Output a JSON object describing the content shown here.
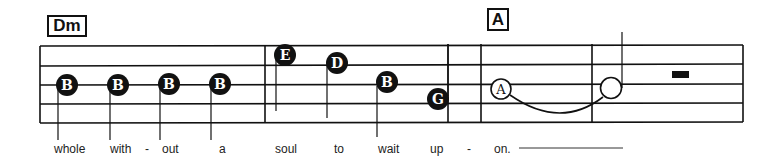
{
  "chords": [
    {
      "label": "Dm"
    },
    {
      "label": "A"
    }
  ],
  "notes": [
    {
      "letter": "B",
      "style": "filled"
    },
    {
      "letter": "B",
      "style": "filled"
    },
    {
      "letter": "B",
      "style": "filled"
    },
    {
      "letter": "B",
      "style": "filled"
    },
    {
      "letter": "E",
      "style": "filled"
    },
    {
      "letter": "D",
      "style": "filled"
    },
    {
      "letter": "B",
      "style": "filled"
    },
    {
      "letter": "G",
      "style": "filled"
    },
    {
      "letter": "A",
      "style": "open"
    },
    {
      "letter": "",
      "style": "open-tied"
    }
  ],
  "lyrics": [
    {
      "text": "whole"
    },
    {
      "text": "with"
    },
    {
      "text": "-"
    },
    {
      "text": "out"
    },
    {
      "text": "a"
    },
    {
      "text": "soul"
    },
    {
      "text": "to"
    },
    {
      "text": "wait"
    },
    {
      "text": "up"
    },
    {
      "text": "-"
    },
    {
      "text": "on."
    }
  ],
  "colors": {
    "ink": "#111111",
    "paper": "#ffffff"
  }
}
